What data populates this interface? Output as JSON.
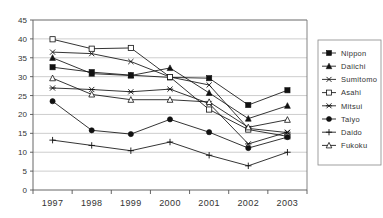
{
  "chart_data": {
    "type": "line",
    "title": "",
    "xlabel": "",
    "ylabel": "",
    "categories": [
      "1997",
      "1998",
      "1999",
      "2000",
      "2001",
      "2002",
      "2003"
    ],
    "x": [
      1997,
      1998,
      1999,
      2000,
      2001,
      2002,
      2003
    ],
    "ylim": [
      0,
      45
    ],
    "yticks": [
      0,
      5,
      10,
      15,
      20,
      25,
      30,
      35,
      40,
      45
    ],
    "ytick_labels": [
      "0",
      "5",
      "10",
      "15",
      "20",
      "25",
      "30",
      "35",
      "40",
      "45"
    ],
    "grid": "horizontal",
    "legend_position": "right",
    "series": [
      {
        "name": "Nippon",
        "marker": "filled-square",
        "values": [
          32.5,
          31.2,
          30.4,
          29.8,
          29.6,
          22.5,
          26.4
        ]
      },
      {
        "name": "Daiichi",
        "marker": "filled-triangle",
        "values": [
          35.0,
          30.8,
          30.3,
          32.3,
          25.7,
          18.9,
          22.3
        ]
      },
      {
        "name": "Sumitomo",
        "marker": "cross-x",
        "values": [
          36.5,
          36.1,
          34.0,
          29.9,
          27.8,
          16.3,
          15.2
        ]
      },
      {
        "name": "Asahi",
        "marker": "open-square",
        "values": [
          39.9,
          37.4,
          37.6,
          29.9,
          21.3,
          16.0,
          14.2
        ]
      },
      {
        "name": "Mitsui",
        "marker": "asterisk",
        "values": [
          27.0,
          26.6,
          26.0,
          26.7,
          22.9,
          12.2,
          15.3
        ]
      },
      {
        "name": "Taiyo",
        "marker": "filled-circle",
        "values": [
          23.5,
          15.8,
          14.8,
          18.7,
          15.3,
          11.1,
          14.0
        ]
      },
      {
        "name": "Daido",
        "marker": "plus",
        "values": [
          13.2,
          11.8,
          10.4,
          12.7,
          9.2,
          6.4,
          10.0
        ]
      },
      {
        "name": "Fukoku",
        "marker": "open-triangle",
        "values": [
          29.6,
          25.3,
          23.9,
          23.9,
          23.3,
          16.6,
          18.6
        ]
      }
    ]
  },
  "colors": {
    "series": "#111111",
    "grid": "#b8b8b8",
    "axis": "#555555",
    "text": "#333333",
    "background": "#ffffff"
  }
}
